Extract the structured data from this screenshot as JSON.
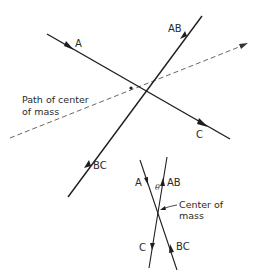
{
  "diagram": {
    "main": {
      "labels": {
        "A": "A",
        "AB": "AB",
        "C": "C",
        "BC": "BC",
        "com_line1": "Path of center",
        "com_line2": "of mass"
      }
    },
    "inset": {
      "labels": {
        "A": "A",
        "AB": "AB",
        "C": "C",
        "BC": "BC",
        "theta": "θ",
        "com_line1": "Center of",
        "com_line2": "mass"
      }
    },
    "colors": {
      "line": "#1e1e1e",
      "dashed": "#555555",
      "text": "#2a2a2a"
    }
  }
}
